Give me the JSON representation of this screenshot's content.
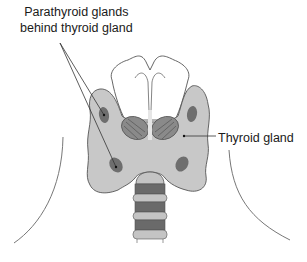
{
  "diagram": {
    "labels": {
      "parathyroid_line1": "Parathyroid glands",
      "parathyroid_line2": "behind thyroid gland",
      "thyroid": "Thyroid gland"
    },
    "colors": {
      "thyroid_fill": "#c8c8c8",
      "parathyroid_fill": "#6e6e6e",
      "cartilage_dark": "#6a6a6a",
      "cartilage_light": "#c4c4c4",
      "outline": "#555555",
      "leader_line": "#333333"
    }
  }
}
